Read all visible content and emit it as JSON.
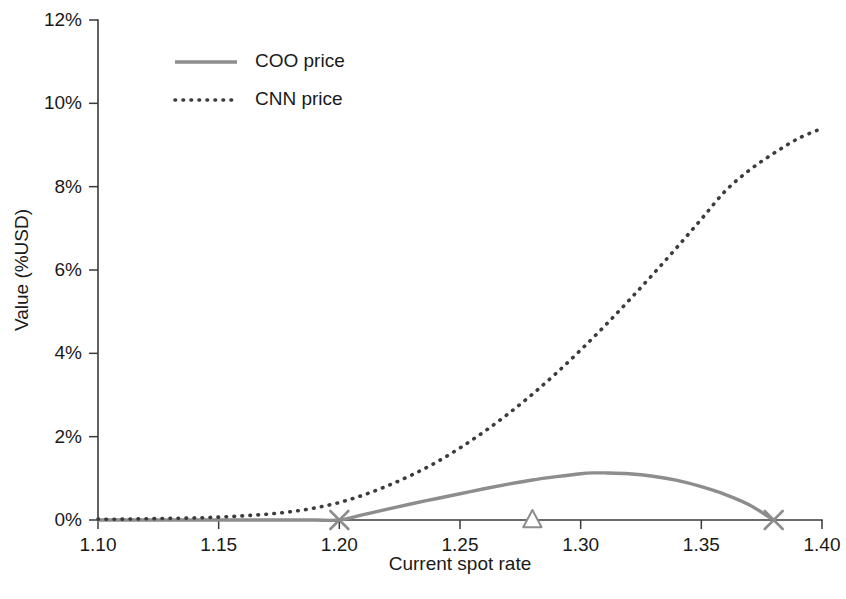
{
  "chart_data": {
    "type": "line",
    "title": "",
    "xlabel": "Current spot rate",
    "ylabel": "Value (%USD)",
    "xlim": [
      1.1,
      1.4
    ],
    "ylim": [
      0,
      12
    ],
    "xticks": [
      1.1,
      1.15,
      1.2,
      1.25,
      1.3,
      1.35,
      1.4
    ],
    "xtick_labels": [
      "1.10",
      "1.15",
      "1.20",
      "1.25",
      "1.30",
      "1.35",
      "1.40"
    ],
    "yticks": [
      0,
      2,
      4,
      6,
      8,
      10,
      12
    ],
    "ytick_labels": [
      "0%",
      "2%",
      "4%",
      "6%",
      "8%",
      "10%",
      "12%"
    ],
    "grid": false,
    "legend_position": "upper-left-inside",
    "series": [
      {
        "name": "COO price",
        "style": "solid",
        "color": "#8d8d8d",
        "x": [
          1.1,
          1.11,
          1.12,
          1.13,
          1.14,
          1.15,
          1.16,
          1.17,
          1.18,
          1.19,
          1.2,
          1.21,
          1.22,
          1.23,
          1.24,
          1.25,
          1.26,
          1.27,
          1.28,
          1.29,
          1.3,
          1.305,
          1.31,
          1.32,
          1.33,
          1.34,
          1.35,
          1.36,
          1.37,
          1.38
        ],
        "values": [
          0.0,
          0.0,
          0.0,
          0.0,
          0.0,
          0.0,
          0.0,
          0.0,
          0.0,
          0.0,
          0.0,
          0.13,
          0.26,
          0.39,
          0.51,
          0.63,
          0.75,
          0.86,
          0.96,
          1.04,
          1.11,
          1.13,
          1.13,
          1.11,
          1.05,
          0.95,
          0.8,
          0.61,
          0.36,
          0.0
        ]
      },
      {
        "name": "CNN price",
        "style": "dotted",
        "color": "#3c3c3c",
        "x": [
          1.1,
          1.11,
          1.12,
          1.13,
          1.14,
          1.15,
          1.16,
          1.17,
          1.18,
          1.19,
          1.2,
          1.21,
          1.22,
          1.23,
          1.24,
          1.25,
          1.26,
          1.27,
          1.28,
          1.29,
          1.3,
          1.31,
          1.32,
          1.33,
          1.34,
          1.35,
          1.36,
          1.37,
          1.38,
          1.39,
          1.4
        ],
        "values": [
          0.02,
          0.02,
          0.03,
          0.04,
          0.05,
          0.07,
          0.1,
          0.14,
          0.2,
          0.29,
          0.42,
          0.6,
          0.82,
          1.08,
          1.38,
          1.73,
          2.12,
          2.55,
          3.02,
          3.53,
          4.08,
          4.66,
          5.27,
          5.9,
          6.55,
          7.22,
          7.9,
          8.4,
          8.8,
          9.15,
          9.4
        ]
      }
    ],
    "markers": [
      {
        "name": "strike-lower",
        "shape": "x",
        "x": 1.2,
        "y": 0.0,
        "color": "#8d8d8d"
      },
      {
        "name": "forward-rate",
        "shape": "triangle",
        "x": 1.28,
        "y": 0.0,
        "color": "#8d8d8d"
      },
      {
        "name": "strike-upper",
        "shape": "x",
        "x": 1.38,
        "y": 0.0,
        "color": "#8d8d8d"
      }
    ],
    "legend": [
      {
        "label": "COO price",
        "style": "solid",
        "color": "#8d8d8d"
      },
      {
        "label": "CNN price",
        "style": "dotted",
        "color": "#3c3c3c"
      }
    ]
  }
}
